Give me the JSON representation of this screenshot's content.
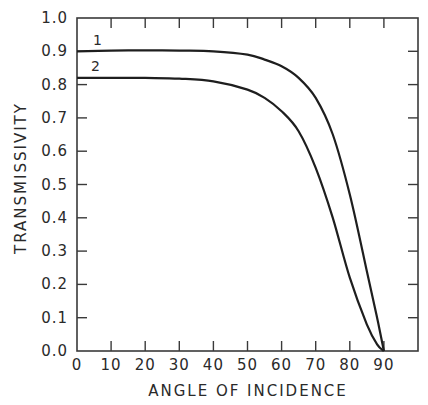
{
  "chart_data": {
    "type": "line",
    "title": "",
    "xlabel": "ANGLE OF INCIDENCE",
    "ylabel": "TRANSMISSIVITY",
    "xlim": [
      0,
      100
    ],
    "ylim": [
      0.0,
      1.0
    ],
    "xticks": [
      "0",
      "10",
      "20",
      "30",
      "40",
      "50",
      "60",
      "70",
      "80",
      "90"
    ],
    "yticks": [
      "0.0",
      "0.1",
      "0.2",
      "0.3",
      "0.4",
      "0.5",
      "0.6",
      "0.7",
      "0.8",
      "0.9",
      "1.0"
    ],
    "grid": false,
    "legend": "inline curve labels",
    "series": [
      {
        "name": "1",
        "x": [
          0,
          10,
          20,
          30,
          40,
          50,
          55,
          60,
          65,
          70,
          75,
          80,
          85,
          88,
          90
        ],
        "values": [
          0.9,
          0.902,
          0.903,
          0.902,
          0.9,
          0.89,
          0.875,
          0.855,
          0.82,
          0.76,
          0.65,
          0.47,
          0.24,
          0.1,
          0.0
        ]
      },
      {
        "name": "2",
        "x": [
          0,
          10,
          20,
          30,
          40,
          50,
          55,
          60,
          65,
          70,
          75,
          80,
          85,
          88,
          90
        ],
        "values": [
          0.82,
          0.82,
          0.82,
          0.818,
          0.81,
          0.785,
          0.76,
          0.72,
          0.66,
          0.55,
          0.4,
          0.22,
          0.08,
          0.02,
          0.0
        ]
      }
    ]
  },
  "colors": {
    "line": "#1e1e1e",
    "axis": "#3a3a3a",
    "background": "#ffffff"
  }
}
